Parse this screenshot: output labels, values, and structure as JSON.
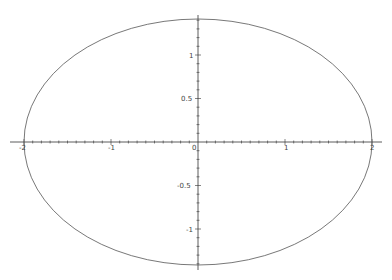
{
  "chart_data": {
    "type": "line",
    "title": "",
    "xlabel": "",
    "ylabel": "",
    "curve": {
      "kind": "ellipse",
      "center": [
        0,
        0
      ],
      "semi_x": 2,
      "semi_y": 1.414
    },
    "xlim": [
      -2.03,
      2.03
    ],
    "ylim": [
      -1.45,
      1.45
    ],
    "x_ticks": [
      "-2",
      "-1",
      "0",
      "1",
      "2"
    ],
    "y_ticks": [
      "1",
      "0.5",
      "0",
      "-0.5",
      "-1"
    ],
    "grid": false,
    "legend": null,
    "axes_through_origin": true,
    "colors": {
      "curve": "#555555",
      "axis": "#333333",
      "background": "#ffffff"
    }
  },
  "labels": {
    "x": {
      "m2": "-2",
      "m1": "-1",
      "zero": "0",
      "p1": "1",
      "p2": "2"
    },
    "y": {
      "p1": "1",
      "p05": "0.5",
      "m05": "-0.5",
      "m1": "-1"
    }
  }
}
